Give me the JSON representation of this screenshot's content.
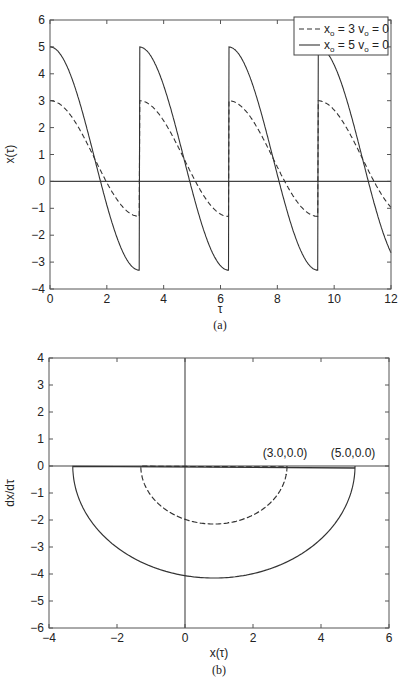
{
  "chart_data": [
    {
      "type": "line",
      "panel": "(a)",
      "title": "",
      "xlabel": "τ",
      "ylabel": "x(τ)",
      "xlim": [
        0,
        12
      ],
      "ylim": [
        -4,
        6
      ],
      "xticks": [
        0,
        2,
        4,
        6,
        8,
        10,
        12
      ],
      "yticks": [
        -4,
        -3,
        -2,
        -1,
        0,
        1,
        2,
        3,
        4,
        5,
        6
      ],
      "grid": false,
      "legend_position": "upper right",
      "reference_lines": [
        {
          "type": "horizontal",
          "y": 0
        }
      ],
      "series": [
        {
          "name": "x_o = 3 v_o = 0",
          "style": "dashed",
          "x": [
            0,
            0.5,
            1.0,
            1.5,
            2.0,
            2.5,
            3.0,
            3.14,
            3.5,
            4.0,
            4.5,
            5.0,
            5.5,
            6.0,
            6.28,
            8,
            10,
            12
          ],
          "y": [
            3.0,
            2.72,
            1.95,
            0.84,
            -0.38,
            -1.0,
            -1.28,
            -1.3,
            -1.27,
            -1.14,
            -0.95,
            -0.72,
            -0.52,
            -0.41,
            -0.4,
            -0.4,
            -0.4,
            -0.4
          ]
        },
        {
          "name": "x_o = 5 v_o = 0",
          "style": "solid",
          "x": [
            0,
            0.5,
            1.0,
            1.5,
            2.0,
            2.5,
            3.0,
            3.14,
            3.5,
            4.0,
            4.5,
            5.0,
            5.5,
            6.0,
            6.28,
            7.0,
            8.0,
            9.0,
            9.42,
            10,
            12
          ],
          "y": [
            5.0,
            4.51,
            3.14,
            1.15,
            -0.91,
            -2.56,
            -3.28,
            -3.3,
            -3.07,
            -2.35,
            -1.04,
            0.1,
            0.97,
            1.53,
            1.6,
            1.43,
            0.8,
            0.2,
            0.1,
            0.1,
            0.1
          ]
        }
      ]
    },
    {
      "type": "line",
      "panel": "(b)",
      "title": "",
      "xlabel": "x(τ)",
      "ylabel": "dx/dτ",
      "xlim": [
        -4,
        6
      ],
      "ylim": [
        -6,
        4
      ],
      "xticks": [
        -4,
        -2,
        0,
        2,
        4,
        6
      ],
      "yticks": [
        -6,
        -5,
        -4,
        -3,
        -2,
        -1,
        0,
        1,
        2,
        3,
        4
      ],
      "grid": false,
      "reference_lines": [
        {
          "type": "horizontal",
          "y": 0
        },
        {
          "type": "vertical",
          "x": 0
        }
      ],
      "annotations": [
        {
          "text": "(3.0,0.0)",
          "x": 3.0,
          "y": 0.0
        },
        {
          "text": "(5.0,0.0)",
          "x": 5.0,
          "y": 0.0
        }
      ],
      "series": [
        {
          "name": "x_o = 3 v_o = 0 (phase trajectory)",
          "style": "dashed",
          "x": [
            3.0,
            2.5,
            1.9,
            0.85,
            -0.2,
            -0.9,
            -1.3,
            -1.1,
            -0.85,
            -0.6,
            -0.4
          ],
          "y": [
            0.0,
            -1.3,
            -1.85,
            -2.15,
            -1.85,
            -1.1,
            0.0,
            0.32,
            0.45,
            0.32,
            0.0
          ],
          "start": [
            3.0,
            0.0
          ],
          "end": [
            -0.4,
            0.0
          ]
        },
        {
          "name": "x_o = 5 v_o = 0 (phase trajectory)",
          "style": "solid",
          "x": [
            5.0,
            4.0,
            2.5,
            0.85,
            -0.8,
            -2.3,
            -3.3,
            -2.6,
            -0.85,
            0.0,
            1.0,
            1.6,
            1.3,
            0.85,
            0.4,
            0.1
          ],
          "y": [
            0.0,
            -2.7,
            -3.8,
            -4.15,
            -3.8,
            -2.7,
            0.0,
            1.75,
            2.45,
            2.25,
            1.5,
            0.0,
            -0.45,
            -0.7,
            -0.45,
            0.0
          ],
          "start": [
            5.0,
            0.0
          ],
          "end": [
            0.1,
            0.0
          ]
        }
      ]
    }
  ],
  "panel_a": {
    "caption": "(a)",
    "xlabel": "τ",
    "ylabel": "x(τ)",
    "legend": [
      {
        "label_main": "x",
        "label_sub1": "o",
        "label_mid": " = 3 v",
        "label_sub2": "o",
        "label_end": " = 0",
        "style": "dashed"
      },
      {
        "label_main": "x",
        "label_sub1": "o",
        "label_mid": " = 5 v",
        "label_sub2": "o",
        "label_end": " = 0",
        "style": "solid"
      }
    ],
    "xticks": [
      "0",
      "2",
      "4",
      "6",
      "8",
      "10",
      "12"
    ],
    "yticks": [
      "−4",
      "−3",
      "−2",
      "−1",
      "0",
      "1",
      "2",
      "3",
      "4",
      "5",
      "6"
    ]
  },
  "panel_b": {
    "caption": "(b)",
    "xlabel": "x(τ)",
    "ylabel": "dx/dτ",
    "annotations": [
      "(3.0,0.0)",
      "(5.0,0.0)"
    ],
    "xticks": [
      "−4",
      "−2",
      "0",
      "2",
      "4",
      "6"
    ],
    "yticks": [
      "−6",
      "−5",
      "−4",
      "−3",
      "−2",
      "−1",
      "0",
      "1",
      "2",
      "3",
      "4"
    ]
  },
  "colors": {
    "line": "#333333",
    "frame": "#555555",
    "text": "#222222",
    "background": "#ffffff"
  }
}
